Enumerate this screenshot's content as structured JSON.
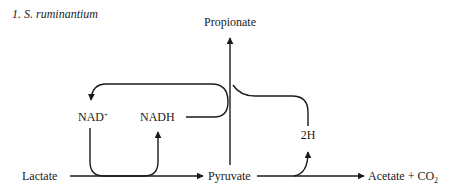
{
  "figure": {
    "title": "1. S. ruminantium",
    "nodes": {
      "propionate": "Propionate",
      "nad_plus": "NAD",
      "nad_plus_sup": "+",
      "nadh": "NADH",
      "two_h": "2H",
      "lactate": "Lactate",
      "pyruvate": "Pyruvate",
      "acetate_co2": "Acetate + CO",
      "acetate_co2_sub": "2"
    },
    "edges": [
      {
        "from": "Lactate",
        "to": "Pyruvate"
      },
      {
        "from": "NAD+",
        "to": "NADH",
        "via": "Lactate→Pyruvate"
      },
      {
        "from": "Pyruvate",
        "to": "Propionate"
      },
      {
        "from": "NADH",
        "to": "NAD+",
        "via": "Pyruvate→Propionate"
      },
      {
        "from": "2H",
        "to": "Propionate",
        "via": "Pyruvate→Propionate"
      },
      {
        "from": "Pyruvate",
        "to": "Acetate + CO2"
      },
      {
        "from": "Pyruvate→Acetate",
        "to": "2H"
      }
    ],
    "colors": {
      "ink": "#1a1a1a",
      "background": "#ffffff"
    }
  }
}
